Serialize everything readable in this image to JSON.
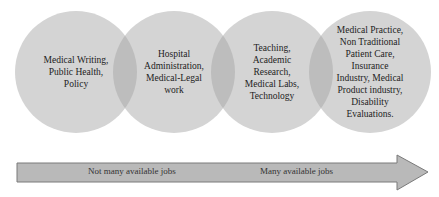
{
  "diagram": {
    "circles": [
      {
        "lines": [
          "Medical Writing,",
          "Public Health,",
          "Policy"
        ]
      },
      {
        "lines": [
          "Hospital",
          "Administration,",
          "Medical-Legal",
          "work"
        ]
      },
      {
        "lines": [
          "Teaching,",
          "Academic",
          "Research,",
          "Medical Labs,",
          "Technology"
        ]
      },
      {
        "lines": [
          "Medical Practice,",
          "Non Traditional",
          "Patient Care,",
          "Insurance",
          "Industry, Medical",
          "Product industry,",
          "Disability",
          "Evaluations."
        ]
      }
    ],
    "arrow": {
      "left_label": "Not many available jobs",
      "right_label": "Many available jobs"
    },
    "colors": {
      "circle_fill": "#d4d4d4",
      "overlap_fill": "#bdbdbd",
      "arrow_fill": "#b9b9b9",
      "arrow_stroke": "#7a7a7a"
    }
  }
}
